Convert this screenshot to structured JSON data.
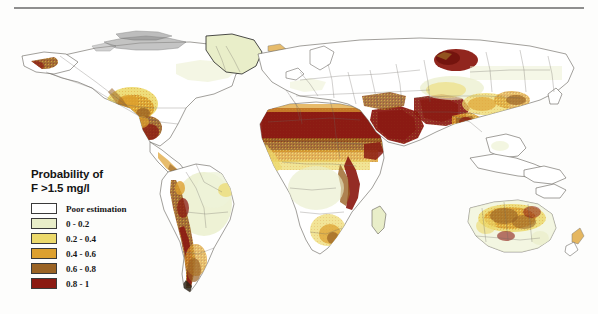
{
  "figure": {
    "has_top_rule": true,
    "background_color": "#fdfdfc"
  },
  "legend": {
    "title_line1": "Probability of",
    "title_line2": "F >1.5 mg/l",
    "entries": [
      {
        "label": "Poor estimation",
        "color": "#ffffff"
      },
      {
        "label": "0 - 0.2",
        "color": "#e9eec9"
      },
      {
        "label": "0.2 - 0.4",
        "color": "#ecd96b"
      },
      {
        "label": "0.4 - 0.6",
        "color": "#dda02e"
      },
      {
        "label": "0.6 - 0.8",
        "color": "#9a6324"
      },
      {
        "label": "0.8 - 1",
        "color": "#8b1a12"
      }
    ]
  },
  "map": {
    "type": "choropleth-world",
    "variable": "Probability of fluoride concentration exceeding 1.5 mg/l in groundwater",
    "projection": "plate-carree",
    "coastline_color": "#55504a",
    "ocean_color": "#fdfdfc",
    "regions": [
      {
        "name": "Sahara and Sahel belt",
        "class": "0.8 - 1",
        "color": "#8b1a12"
      },
      {
        "name": "Arabian Peninsula",
        "class": "0.8 - 1",
        "color": "#8b1a12"
      },
      {
        "name": "East African Rift Valley",
        "class": "0.8 - 1",
        "color": "#8b1a12"
      },
      {
        "name": "Iran and Central Asia",
        "class": "0.8 - 1",
        "color": "#8b1a12"
      },
      {
        "name": "Central Siberia",
        "class": "0.8 - 1",
        "color": "#8b1a12"
      },
      {
        "name": "Andes and Argentine Pampas",
        "class": "0.8 - 1",
        "color": "#8b1a12"
      },
      {
        "name": "North India",
        "class": "0.6 - 0.8",
        "color": "#9a6324"
      },
      {
        "name": "Northern China",
        "class": "0.6 - 0.8",
        "color": "#9a6324"
      },
      {
        "name": "Southwestern United States",
        "class": "0.4 - 0.6",
        "color": "#dda02e"
      },
      {
        "name": "Northern Mexico",
        "class": "0.6 - 0.8",
        "color": "#9a6324"
      },
      {
        "name": "Interior Australia",
        "class": "0.4 - 0.6",
        "color": "#dda02e"
      },
      {
        "name": "Southern Africa",
        "class": "0.4 - 0.6",
        "color": "#dda02e"
      },
      {
        "name": "Amazon Basin",
        "class": "0 - 0.2",
        "color": "#e9eec9"
      },
      {
        "name": "Northern Europe",
        "class": "Poor estimation",
        "color": "#ffffff"
      },
      {
        "name": "Greenland",
        "class": "0 - 0.2",
        "color": "#e9eec9"
      },
      {
        "name": "Arctic Canada",
        "class": "Poor estimation",
        "color": "#ffffff"
      }
    ]
  }
}
